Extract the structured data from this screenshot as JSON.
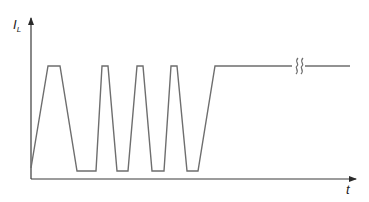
{
  "diagram": {
    "title": "",
    "y_axis": {
      "label_main": "I",
      "label_sub": "L"
    },
    "x_axis": {
      "label": "t"
    },
    "colors": {
      "line": "#6e6e6e",
      "axis": "#3a3a3a",
      "text": "#222222"
    },
    "waveform": {
      "description": "Inductor current waveform: initial ramp up, four trapezoidal pulses, then steady high level with a break mark",
      "levels": {
        "low": 171,
        "high": 66
      },
      "points": [
        [
          31,
          168
        ],
        [
          48,
          66
        ],
        [
          60,
          66
        ],
        [
          77,
          171
        ],
        [
          96,
          171
        ],
        [
          102,
          66
        ],
        [
          108,
          66
        ],
        [
          117,
          171
        ],
        [
          128,
          171
        ],
        [
          137,
          66
        ],
        [
          143,
          66
        ],
        [
          152,
          171
        ],
        [
          164,
          171
        ],
        [
          171,
          66
        ],
        [
          177,
          66
        ],
        [
          187,
          171
        ],
        [
          198,
          171
        ],
        [
          215,
          66
        ],
        [
          292,
          66
        ]
      ],
      "continuation": {
        "from": [
          305,
          66
        ],
        "to": [
          350,
          66
        ]
      },
      "break_mark": {
        "x1": 297,
        "x2": 302,
        "y": 66
      }
    }
  }
}
